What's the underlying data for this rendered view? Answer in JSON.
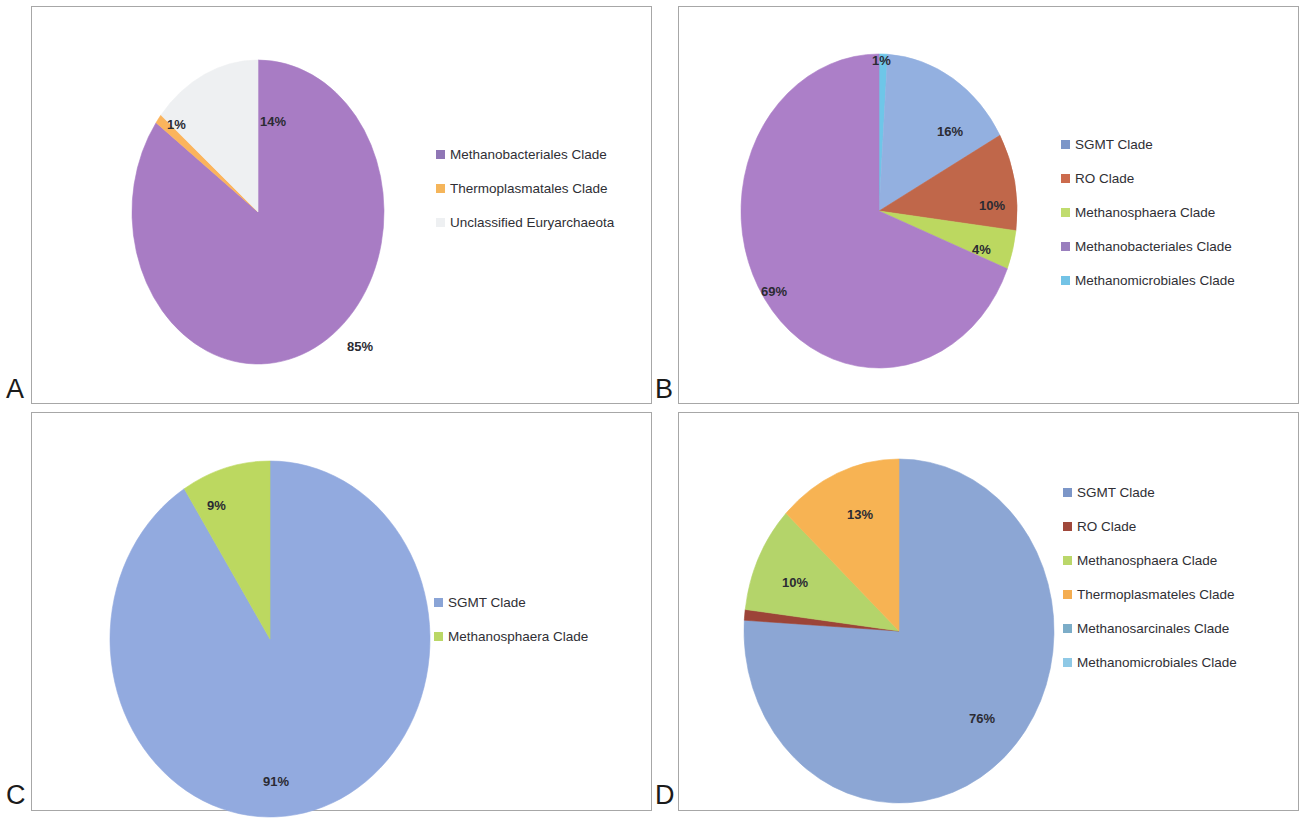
{
  "figure": {
    "background": "#ffffff",
    "panel_border_color": "#a7a7a7"
  },
  "panels": [
    {
      "letter": "A",
      "pie": {
        "cx": 157,
        "cy": 158,
        "r": 126,
        "rx": 126,
        "ry": 152
      },
      "legend_swatch_size": 9
    },
    {
      "letter": "B",
      "pie": {
        "cx": 140,
        "cy": 178,
        "r": 138,
        "rx": 138,
        "ry": 157
      },
      "legend_swatch_size": 9
    },
    {
      "letter": "C",
      "pie": {
        "cx": 165,
        "cy": 185,
        "r": 160,
        "rx": 160,
        "ry": 178
      },
      "legend_swatch_size": 9
    },
    {
      "letter": "D",
      "pie": {
        "cx": 158,
        "cy": 175,
        "r": 155,
        "rx": 155,
        "ry": 172
      },
      "legend_swatch_size": 9
    }
  ],
  "chart_data": [
    {
      "panel": "A",
      "type": "pie",
      "title": "",
      "legend_position": "right",
      "start_angle_deg": 0,
      "direction": "clockwise",
      "categories": [
        "Methanobacteriales Clade",
        "Thermoplasmatales Clade",
        "Unclassified Euryarchaeota"
      ],
      "values": [
        85,
        1,
        14
      ],
      "value_labels": [
        "85%",
        "1%",
        "14%"
      ],
      "colors": [
        "#a87cc4",
        "#fbb45c",
        "#eef0f2"
      ],
      "legend": [
        {
          "label": "Methanobacteriales Clade",
          "color": "#8f76b5"
        },
        {
          "label": "Thermoplasmatales Clade",
          "color": "#f5b55a"
        },
        {
          "label": "Unclassified Euryarchaeota",
          "color": "#eef0f2"
        }
      ],
      "label_positions": [
        {
          "text": "85%",
          "x": 215,
          "y": 277,
          "inside": true
        },
        {
          "text": "1%",
          "x": 35,
          "y": 55,
          "inside": false
        },
        {
          "text": "14%",
          "x": 128,
          "y": 52,
          "inside": true
        }
      ]
    },
    {
      "panel": "B",
      "type": "pie",
      "title": "",
      "legend_position": "right",
      "start_angle_deg": 0,
      "direction": "clockwise",
      "categories": [
        "Methanomicrobiales Clade",
        "SGMT Clade",
        "RO Clade",
        "Methanosphaera Clade",
        "Methanobacteriales Clade"
      ],
      "values": [
        1,
        16,
        10,
        4,
        69
      ],
      "value_labels": [
        "1%",
        "16%",
        "10%",
        "4%",
        "69%"
      ],
      "colors": [
        "#6ec6e8",
        "#93b0e0",
        "#c0674a",
        "#bcd860",
        "#ac7fc8"
      ],
      "legend": [
        {
          "label": "SGMT Clade",
          "color": "#7c96c8"
        },
        {
          "label": "RO Clade",
          "color": "#cc6b4d"
        },
        {
          "label": "Methanosphaera Clade",
          "color": "#c0dc6e"
        },
        {
          "label": "Methanobacteriales Clade",
          "color": "#9a7fbe"
        },
        {
          "label": "Methanomicrobiales Clade",
          "color": "#73c3e6"
        }
      ],
      "label_positions": [
        {
          "text": "1%",
          "x": 131,
          "y": -3,
          "inside": false
        },
        {
          "text": "16%",
          "x": 196,
          "y": 68,
          "inside": true
        },
        {
          "text": "10%",
          "x": 238,
          "y": 142,
          "inside": true
        },
        {
          "text": "4%",
          "x": 231,
          "y": 186,
          "inside": true
        },
        {
          "text": "69%",
          "x": 20,
          "y": 228,
          "inside": true
        }
      ]
    },
    {
      "panel": "C",
      "type": "pie",
      "title": "",
      "legend_position": "right",
      "start_angle_deg": 0,
      "direction": "clockwise",
      "categories": [
        "SGMT Clade",
        "Methanosphaera Clade"
      ],
      "values": [
        91,
        9
      ],
      "value_labels": [
        "91%",
        "9%"
      ],
      "colors": [
        "#92aadf",
        "#bcd860"
      ],
      "legend": [
        {
          "label": "SGMT Clade",
          "color": "#8aa4d6"
        },
        {
          "label": "Methanosphaera Clade",
          "color": "#bad766"
        }
      ],
      "label_positions": [
        {
          "text": "91%",
          "x": 153,
          "y": 311,
          "inside": true
        },
        {
          "text": "9%",
          "x": 97,
          "y": 35,
          "inside": true
        }
      ]
    },
    {
      "panel": "D",
      "type": "pie",
      "title": "",
      "legend_position": "right",
      "start_angle_deg": 0,
      "direction": "clockwise",
      "categories": [
        "SGMT Clade",
        "RO Clade",
        "Methanosphaera Clade",
        "Thermoplasmateles Clade",
        "Methanosarcinales Clade",
        "Methanomicrobiales Clade"
      ],
      "values": [
        76,
        1,
        10,
        13,
        0,
        0
      ],
      "value_labels": [
        "76%",
        "1%",
        "10%",
        "13%",
        "",
        ""
      ],
      "colors": [
        "#8ca6d4",
        "#9c4438",
        "#b4d46a",
        "#f7b353",
        "#7fb4cf",
        "#8fc9e6"
      ],
      "legend": [
        {
          "label": "SGMT Clade",
          "color": "#7c96c8"
        },
        {
          "label": "RO Clade",
          "color": "#a0483b"
        },
        {
          "label": "Methanosphaera Clade",
          "color": "#bad76a"
        },
        {
          "label": "Thermoplasmateles Clade",
          "color": "#f4ad51"
        },
        {
          "label": "Methanosarcinales Clade",
          "color": "#7cadc8"
        },
        {
          "label": "Methanomicrobiales Clade",
          "color": "#8fc9e6"
        }
      ],
      "label_positions": [
        {
          "text": "76%",
          "x": 225,
          "y": 250,
          "inside": true
        },
        {
          "text": "1%",
          "x": -42,
          "y": 160,
          "inside": false
        },
        {
          "text": "10%",
          "x": 38,
          "y": 114,
          "inside": true
        },
        {
          "text": "13%",
          "x": 103,
          "y": 46,
          "inside": true
        }
      ]
    }
  ]
}
